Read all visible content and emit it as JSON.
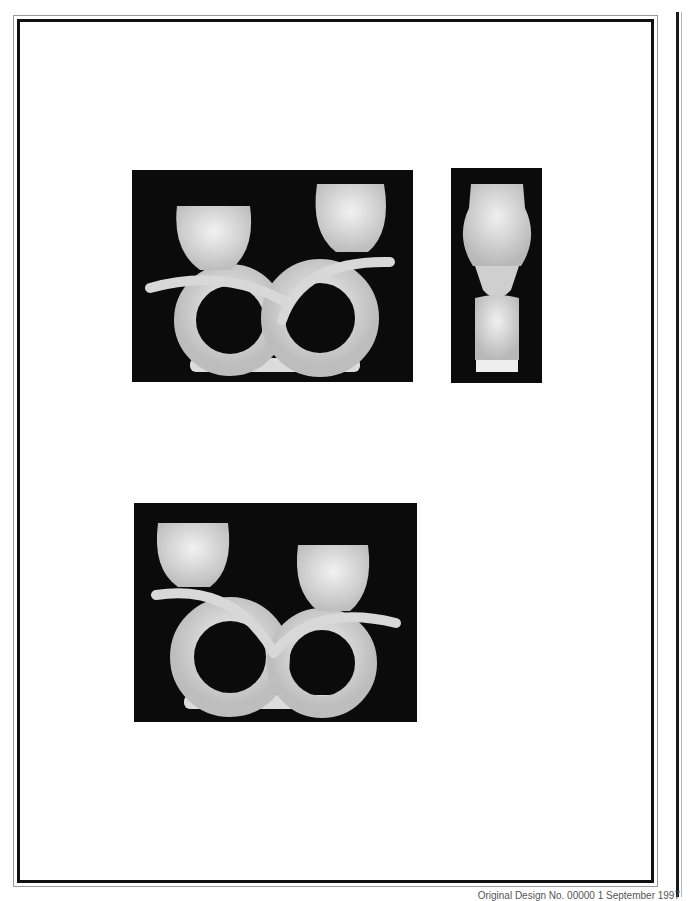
{
  "document": {
    "type": "design patent drawing sheet",
    "figures": [
      {
        "id": "fig1",
        "label": "front view of double candle holder"
      },
      {
        "id": "fig2",
        "label": "side view of candle holder"
      },
      {
        "id": "fig3",
        "label": "rear view of double candle holder"
      }
    ],
    "footer": "Original Design No. 00000 1 September 1997",
    "colors": {
      "background": "#ffffff",
      "frame": "#111111",
      "photo_bg": "#0b0b0b",
      "object": "#e6e6e6"
    }
  }
}
